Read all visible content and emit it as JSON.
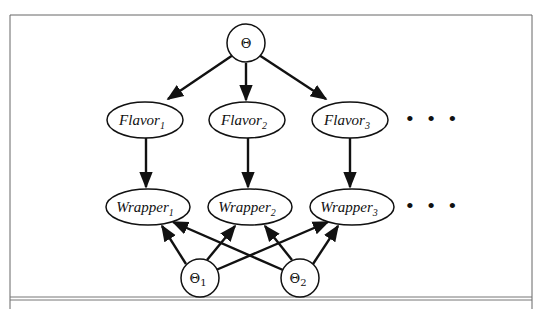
{
  "diagram": {
    "type": "bayesian-network",
    "root": {
      "id": "theta",
      "label": "Θ",
      "sub": ""
    },
    "flavors": [
      {
        "id": "flavor1",
        "label": "Flavor",
        "sub": "1"
      },
      {
        "id": "flavor2",
        "label": "Flavor",
        "sub": "2"
      },
      {
        "id": "flavor3",
        "label": "Flavor",
        "sub": "3"
      }
    ],
    "wrappers": [
      {
        "id": "wrapper1",
        "label": "Wrapper",
        "sub": "1"
      },
      {
        "id": "wrapper2",
        "label": "Wrapper",
        "sub": "2"
      },
      {
        "id": "wrapper3",
        "label": "Wrapper",
        "sub": "3"
      }
    ],
    "params": [
      {
        "id": "theta1",
        "label": "Θ",
        "sub": "1"
      },
      {
        "id": "theta2",
        "label": "Θ",
        "sub": "2"
      }
    ],
    "ellipsis": "• • •",
    "edges": [
      [
        "theta",
        "flavor1"
      ],
      [
        "theta",
        "flavor2"
      ],
      [
        "theta",
        "flavor3"
      ],
      [
        "flavor1",
        "wrapper1"
      ],
      [
        "flavor2",
        "wrapper2"
      ],
      [
        "flavor3",
        "wrapper3"
      ],
      [
        "theta1",
        "wrapper1"
      ],
      [
        "theta1",
        "wrapper2"
      ],
      [
        "theta1",
        "wrapper3"
      ],
      [
        "theta2",
        "wrapper1"
      ],
      [
        "theta2",
        "wrapper2"
      ],
      [
        "theta2",
        "wrapper3"
      ]
    ]
  }
}
